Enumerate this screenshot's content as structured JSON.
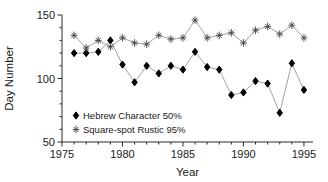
{
  "figure": {
    "background": "#ffffff",
    "axis_color": "#2a2a2a",
    "text_color": "#1a1a1a"
  },
  "chart_data": {
    "type": "line",
    "title": "",
    "xlabel": "Year",
    "ylabel": "Day Number",
    "xlim": [
      1975,
      1995.75
    ],
    "ylim": [
      50,
      150
    ],
    "x_ticks_major": [
      1975,
      1980,
      1985,
      1990,
      1995
    ],
    "x_minor_step": 1,
    "y_ticks_major": [
      50,
      100,
      150
    ],
    "y_minor_step": 10,
    "grid": "off",
    "legend_position": "lower-left-inside",
    "x": [
      1976,
      1977,
      1978,
      1979,
      1980,
      1981,
      1982,
      1983,
      1984,
      1985,
      1986,
      1987,
      1988,
      1989,
      1990,
      1991,
      1992,
      1993,
      1994,
      1995
    ],
    "series": [
      {
        "name": "Hebrew Character 50%",
        "marker": "diamond",
        "marker_color": "#000000",
        "line_color": "#999999",
        "values": [
          120,
          120,
          121,
          130,
          111,
          97,
          110,
          104,
          110,
          107,
          121,
          109,
          107,
          87,
          89,
          98,
          96,
          73,
          112,
          91
        ]
      },
      {
        "name": "Square-spot Rustic 95%",
        "marker": "asterisk",
        "marker_color": "#444444",
        "line_color": "#999999",
        "values": [
          134,
          124,
          130,
          125,
          132,
          128,
          127,
          134,
          131,
          132,
          146,
          132,
          134,
          136,
          128,
          138,
          141,
          135,
          142,
          132
        ]
      }
    ]
  }
}
